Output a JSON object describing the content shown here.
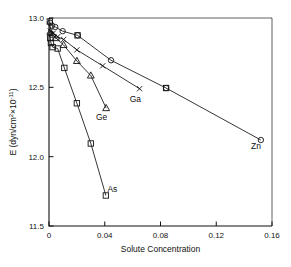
{
  "chart_data": {
    "type": "line",
    "title": "",
    "xlabel": "Solute Concentration",
    "ylabel": "E (dyn/cm²×10⁻¹¹)",
    "ylabel_parts": {
      "main": "E (dyn/cm",
      "sup1": "2",
      "mid": "×10",
      "sup2": "-11",
      "tail": ")"
    },
    "xlim": [
      0,
      0.16
    ],
    "ylim": [
      11.5,
      13.0
    ],
    "xticks": [
      0,
      0.04,
      0.08,
      0.12,
      0.16
    ],
    "xticklabels": [
      "0",
      "0.04",
      "0.08",
      "0.12",
      "0.16"
    ],
    "yticks": [
      11.5,
      12.0,
      12.5,
      13.0
    ],
    "yticklabels": [
      "11.5",
      "12.0",
      "12.5",
      "13.0"
    ],
    "grid": false,
    "legend": "inline-annotations",
    "series": [
      {
        "name": "Zn",
        "label": "Zn",
        "marker": "circle",
        "label_x": 0.1485,
        "label_y": 12.055,
        "points": [
          {
            "x": 0.0008,
            "y": 12.965
          },
          {
            "x": 0.0022,
            "y": 12.945
          },
          {
            "x": 0.0045,
            "y": 12.935
          },
          {
            "x": 0.0098,
            "y": 12.905
          },
          {
            "x": 0.0205,
            "y": 12.875
          },
          {
            "x": 0.0445,
            "y": 12.695
          },
          {
            "x": 0.084,
            "y": 12.495
          },
          {
            "x": 0.152,
            "y": 12.12
          }
        ]
      },
      {
        "name": "Ga",
        "label": "Ga",
        "marker": "cross",
        "label_x": 0.062,
        "label_y": 12.395,
        "points": [
          {
            "x": 0.001,
            "y": 12.905
          },
          {
            "x": 0.003,
            "y": 12.89
          },
          {
            "x": 0.0062,
            "y": 12.865
          },
          {
            "x": 0.0105,
            "y": 12.845
          },
          {
            "x": 0.02,
            "y": 12.77
          },
          {
            "x": 0.0385,
            "y": 12.655
          },
          {
            "x": 0.065,
            "y": 12.49
          }
        ]
      },
      {
        "name": "Ge",
        "label": "Ge",
        "marker": "triangle",
        "label_x": 0.0378,
        "label_y": 12.265,
        "points": [
          {
            "x": 0.0009,
            "y": 12.9
          },
          {
            "x": 0.0026,
            "y": 12.88
          },
          {
            "x": 0.005,
            "y": 12.855
          },
          {
            "x": 0.0105,
            "y": 12.805
          },
          {
            "x": 0.02,
            "y": 12.69
          },
          {
            "x": 0.03,
            "y": 12.585
          },
          {
            "x": 0.041,
            "y": 12.35
          }
        ]
      },
      {
        "name": "As",
        "label": "As",
        "marker": "square",
        "label_x": 0.0455,
        "label_y": 11.745,
        "points": [
          {
            "x": 0.0006,
            "y": 12.975
          },
          {
            "x": 0.0009,
            "y": 12.855
          },
          {
            "x": 0.0014,
            "y": 12.82
          },
          {
            "x": 0.0026,
            "y": 12.79
          },
          {
            "x": 0.0062,
            "y": 12.78
          },
          {
            "x": 0.011,
            "y": 12.64
          },
          {
            "x": 0.02,
            "y": 12.385
          },
          {
            "x": 0.03,
            "y": 12.095
          },
          {
            "x": 0.0408,
            "y": 11.72
          }
        ]
      }
    ],
    "extra_markers": [
      {
        "series": "Zn",
        "marker": "square",
        "x": 0.084,
        "y": 12.495
      },
      {
        "series": "Zn",
        "marker": "square",
        "x": 0.0205,
        "y": 12.875
      }
    ]
  }
}
